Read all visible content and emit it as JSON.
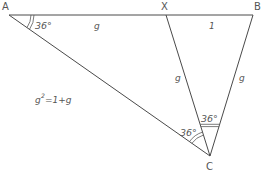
{
  "diagram": {
    "vertices": {
      "A": {
        "label": "A",
        "x": 9,
        "y": 15
      },
      "X": {
        "label": "X",
        "x": 166,
        "y": 15
      },
      "B": {
        "label": "B",
        "x": 253,
        "y": 15
      },
      "C": {
        "label": "C",
        "x": 210,
        "y": 156
      }
    },
    "side_labels": {
      "AX": "g",
      "XB": "1",
      "XC": "g",
      "BC": "g"
    },
    "angles": {
      "A": "36°",
      "ACX": "36°",
      "XCB": "36°"
    },
    "equation": {
      "base": "g",
      "exponent": "2",
      "rhs": "=1+g"
    },
    "colors": {
      "line": "#4a4a4a",
      "text": "#555555",
      "background": "#ffffff"
    }
  }
}
